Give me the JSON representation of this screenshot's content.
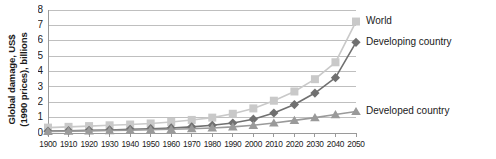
{
  "axes": {
    "ylabel_line1": "Global damage, US$",
    "ylabel_line2": "(1990 prices), billions",
    "y_ticks": [
      "0",
      "1",
      "2",
      "3",
      "4",
      "5",
      "6",
      "7",
      "8"
    ],
    "x_ticks": [
      "1900",
      "1910",
      "1920",
      "1930",
      "1940",
      "1950",
      "1960",
      "1970",
      "1980",
      "1990",
      "2000",
      "2010",
      "2020",
      "2030",
      "2040",
      "2050"
    ]
  },
  "labels": {
    "world": "World",
    "developing": "Developing country",
    "developed": "Developed country"
  },
  "colors": {
    "world": "#c9c9c9",
    "developing": "#707070",
    "developed": "#9a9a9a",
    "grid": "#bfbfbf",
    "axis": "#9a9a9a",
    "text": "#1a1a1a"
  },
  "chart_data": {
    "type": "line",
    "title": "",
    "xlabel": "",
    "ylabel": "Global damage, US$ (1990 prices), billions",
    "xlim": [
      1900,
      2050
    ],
    "ylim": [
      0,
      8
    ],
    "grid": true,
    "legend_position": "right-inline-at-line-ends",
    "categories": [
      1900,
      1910,
      1920,
      1930,
      1940,
      1950,
      1960,
      1970,
      1980,
      1990,
      2000,
      2010,
      2020,
      2030,
      2040,
      2050
    ],
    "series": [
      {
        "name": "World",
        "marker": "square",
        "color": "#c9c9c9",
        "values": [
          0.35,
          0.4,
          0.45,
          0.5,
          0.55,
          0.62,
          0.72,
          0.85,
          1.0,
          1.25,
          1.6,
          2.1,
          2.7,
          3.5,
          4.6,
          7.25
        ]
      },
      {
        "name": "Developing country",
        "marker": "diamond",
        "color": "#707070",
        "values": [
          0.12,
          0.15,
          0.18,
          0.2,
          0.24,
          0.28,
          0.33,
          0.4,
          0.5,
          0.65,
          0.9,
          1.3,
          1.85,
          2.6,
          3.6,
          5.9
        ]
      },
      {
        "name": "Developed country",
        "marker": "triangle",
        "color": "#9a9a9a",
        "values": [
          0.1,
          0.12,
          0.14,
          0.16,
          0.18,
          0.21,
          0.24,
          0.28,
          0.33,
          0.4,
          0.5,
          0.65,
          0.82,
          1.0,
          1.2,
          1.4
        ]
      }
    ]
  }
}
